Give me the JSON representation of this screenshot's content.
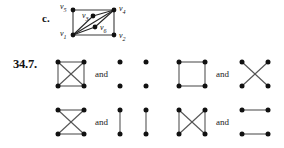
{
  "page": {
    "width": 284,
    "height": 148,
    "background": "#ffffff",
    "ink": "#111111",
    "edge_color": "#3c3c3c",
    "vertex_color": "#111111"
  },
  "part_c": {
    "label": "c.",
    "graph_name": "labeled-graph-c",
    "vertices": [
      {
        "id": "v1",
        "label": "v",
        "sub": "1",
        "x": 18,
        "y": 30,
        "label_pos": "left-below"
      },
      {
        "id": "v2",
        "label": "v",
        "sub": "2",
        "x": 62,
        "y": 30,
        "label_pos": "right-below"
      },
      {
        "id": "v3",
        "label": "v",
        "sub": "3",
        "x": 40,
        "y": 11,
        "label_pos": "left"
      },
      {
        "id": "v4",
        "label": "v",
        "sub": "4",
        "x": 62,
        "y": 5,
        "label_pos": "right"
      },
      {
        "id": "v5",
        "label": "v",
        "sub": "5",
        "x": 18,
        "y": 5,
        "label_pos": "left-above"
      },
      {
        "id": "v6",
        "label": "v",
        "sub": "6",
        "x": 42,
        "y": 22,
        "label_pos": "right"
      }
    ],
    "edges": [
      [
        "v5",
        "v4"
      ],
      [
        "v5",
        "v1"
      ],
      [
        "v1",
        "v2"
      ],
      [
        "v2",
        "v4"
      ],
      [
        "v1",
        "v4"
      ],
      [
        "v1",
        "v3"
      ],
      [
        "v3",
        "v4"
      ],
      [
        "v1",
        "v6"
      ],
      [
        "v6",
        "v4"
      ]
    ]
  },
  "exercise": {
    "number": "34.7.",
    "conjunction": "and",
    "rows": [
      {
        "row_name": "exercise-row-1",
        "pairs": [
          {
            "pair_name": "graph-pair-1",
            "left": {
              "graph_name": "graph-k4-complete",
              "edges": [
                [
                  "tl",
                  "tr"
                ],
                [
                  "tl",
                  "bl"
                ],
                [
                  "tr",
                  "br"
                ],
                [
                  "bl",
                  "br"
                ],
                [
                  "tl",
                  "br"
                ],
                [
                  "tr",
                  "bl"
                ]
              ]
            },
            "conjunction": "and",
            "right": {
              "graph_name": "graph-empty-four-vertices",
              "edges": []
            }
          },
          {
            "pair_name": "graph-pair-2",
            "left": {
              "graph_name": "graph-four-cycle-square",
              "edges": [
                [
                  "tl",
                  "tr"
                ],
                [
                  "tl",
                  "bl"
                ],
                [
                  "tr",
                  "br"
                ],
                [
                  "bl",
                  "br"
                ]
              ]
            },
            "conjunction": "and",
            "right": {
              "graph_name": "graph-two-diagonals-x",
              "edges": [
                [
                  "tl",
                  "br"
                ],
                [
                  "tr",
                  "bl"
                ]
              ]
            }
          }
        ]
      },
      {
        "row_name": "exercise-row-2",
        "pairs": [
          {
            "pair_name": "graph-pair-3",
            "left": {
              "graph_name": "graph-top-bottom-and-diagonals",
              "edges": [
                [
                  "tl",
                  "tr"
                ],
                [
                  "bl",
                  "br"
                ],
                [
                  "tl",
                  "br"
                ],
                [
                  "tr",
                  "bl"
                ]
              ]
            },
            "conjunction": "and",
            "right": {
              "graph_name": "graph-two-vertical-edges",
              "edges": [
                [
                  "tl",
                  "bl"
                ],
                [
                  "tr",
                  "br"
                ]
              ]
            }
          },
          {
            "pair_name": "graph-pair-4",
            "left": {
              "graph_name": "graph-sides-and-diagonals",
              "edges": [
                [
                  "tl",
                  "bl"
                ],
                [
                  "tr",
                  "br"
                ],
                [
                  "tl",
                  "br"
                ],
                [
                  "tr",
                  "bl"
                ]
              ]
            },
            "conjunction": "and",
            "right": {
              "graph_name": "graph-two-horizontal-edges",
              "edges": [
                [
                  "tl",
                  "tr"
                ],
                [
                  "bl",
                  "br"
                ]
              ]
            }
          }
        ]
      }
    ]
  }
}
